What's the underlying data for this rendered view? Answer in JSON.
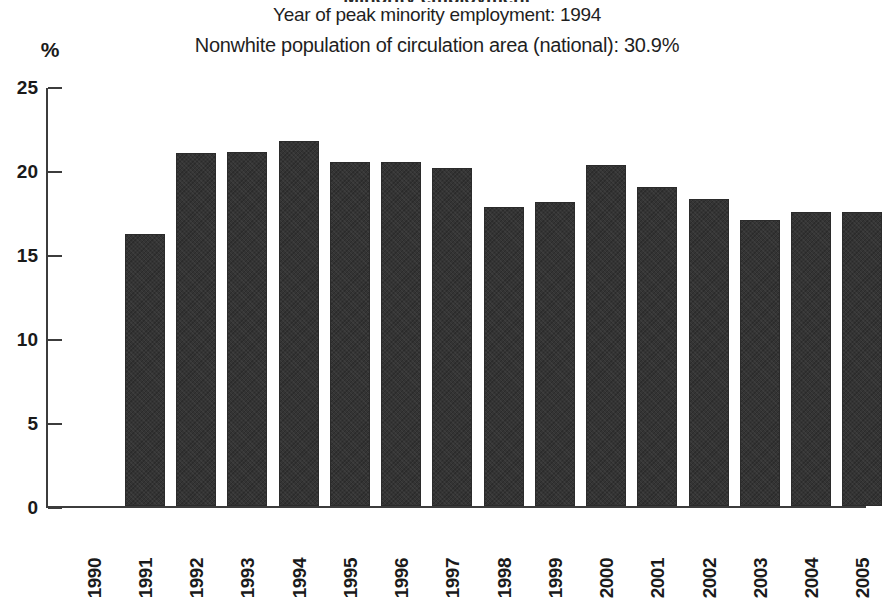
{
  "chart_data": {
    "type": "bar",
    "title": "Minority employment",
    "subtitle_1": "Year of peak minority employment: 1994",
    "subtitle_2": "Nonwhite population of circulation area (national): 30.9%",
    "ylabel": "%",
    "xlabel": "",
    "ylim": [
      0,
      25
    ],
    "yticks": [
      0,
      5,
      10,
      15,
      20,
      25
    ],
    "ytick_labels": [
      "0",
      "5",
      "10",
      "15",
      "20",
      "25"
    ],
    "grid": false,
    "legend": "none",
    "categories": [
      "1990",
      "1991",
      "1992",
      "1993",
      "1994",
      "1995",
      "1996",
      "1997",
      "1998",
      "1999",
      "2000",
      "2001",
      "2002",
      "2003",
      "2004",
      "2005"
    ],
    "values": [
      null,
      16.2,
      21.0,
      21.1,
      21.7,
      20.5,
      20.5,
      20.1,
      17.8,
      18.1,
      20.3,
      19.0,
      18.3,
      17.0,
      17.5,
      17.5
    ],
    "bar_color": "#343434",
    "axis_color": "#3c3c3c",
    "background_color": "#ffffff",
    "annotations": {
      "peak_year": "1994",
      "nonwhite_population_national": "30.9%"
    }
  }
}
